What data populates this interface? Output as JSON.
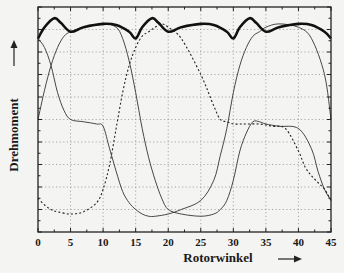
{
  "chart_data": {
    "type": "line",
    "title": "",
    "xlabel": "Rotorwinkel",
    "ylabel": "Drehmoment",
    "xlim": [
      0,
      45
    ],
    "ylim": [
      0,
      10
    ],
    "x_ticks": [
      0,
      5,
      10,
      15,
      20,
      25,
      30,
      35,
      40,
      45
    ],
    "x_tick_labels": [
      "0",
      "5",
      "10",
      "15",
      "20",
      "25",
      "30",
      "35",
      "40",
      "45"
    ],
    "y_ticks_labeled": false,
    "grid": true,
    "legend": "none",
    "series": [
      {
        "name": "Gesamtmoment",
        "style": "thick-solid",
        "x": [
          0,
          1,
          2.5,
          3.5,
          5,
          7,
          10,
          12,
          14,
          15,
          16,
          17.5,
          18.5,
          20,
          22,
          25,
          27,
          29,
          30,
          31,
          32.5,
          33.5,
          35,
          37,
          40,
          42,
          44,
          45
        ],
        "y": [
          8.6,
          9.1,
          9.5,
          9.3,
          8.9,
          9.1,
          9.25,
          9.2,
          8.9,
          8.6,
          9.1,
          9.5,
          9.3,
          8.9,
          9.1,
          9.25,
          9.2,
          8.9,
          8.6,
          9.1,
          9.5,
          9.3,
          8.9,
          9.1,
          9.25,
          9.2,
          8.9,
          8.6
        ]
      },
      {
        "name": "Strang 1",
        "style": "thin-solid",
        "x": [
          0,
          1,
          2,
          3,
          4,
          5,
          7,
          10,
          12,
          13,
          14,
          15,
          16,
          17,
          18,
          19,
          20,
          22,
          25,
          27,
          28,
          29,
          30,
          31,
          32,
          33,
          34,
          35,
          37,
          40,
          42,
          43,
          44,
          45
        ],
        "y": [
          5.0,
          6.3,
          7.4,
          8.2,
          8.7,
          8.9,
          9.1,
          9.25,
          9.1,
          8.6,
          7.6,
          6.2,
          4.6,
          3.3,
          2.3,
          1.5,
          1.0,
          0.8,
          0.7,
          0.8,
          1.0,
          1.4,
          2.3,
          3.6,
          4.4,
          4.9,
          4.9,
          4.8,
          4.7,
          4.6,
          3.7,
          2.7,
          1.9,
          1.4
        ]
      },
      {
        "name": "Strang 2",
        "style": "thin-solid",
        "x": [
          0,
          1,
          2,
          3,
          4,
          5,
          7,
          9,
          10,
          11,
          12,
          13,
          14,
          15,
          16,
          17,
          18,
          20,
          22,
          25,
          27,
          28,
          29,
          30,
          31,
          32,
          33,
          34,
          35,
          37,
          40,
          42,
          44,
          45
        ],
        "y": [
          8.6,
          8.2,
          7.4,
          6.2,
          5.4,
          5.0,
          4.9,
          4.8,
          4.7,
          3.7,
          2.7,
          1.8,
          1.3,
          1.0,
          0.8,
          0.7,
          0.7,
          0.8,
          1.0,
          1.4,
          2.3,
          3.4,
          4.6,
          6.2,
          7.4,
          8.2,
          8.7,
          8.9,
          9.1,
          9.25,
          9.1,
          8.6,
          7.0,
          5.0
        ]
      },
      {
        "name": "Strang 3",
        "style": "dashed",
        "x": [
          0,
          1,
          2,
          3,
          5,
          7,
          9,
          10,
          11,
          12,
          13,
          14,
          15,
          16,
          17,
          18,
          19,
          20,
          22,
          25,
          27,
          28,
          29,
          30,
          31,
          32,
          34,
          36,
          38,
          40,
          41,
          42,
          43,
          44,
          45
        ],
        "y": [
          1.5,
          1.2,
          1.0,
          0.9,
          0.8,
          0.9,
          1.3,
          1.9,
          3.0,
          4.6,
          6.2,
          7.4,
          8.2,
          8.7,
          8.9,
          9.1,
          9.25,
          9.1,
          8.6,
          7.0,
          5.6,
          5.0,
          4.9,
          4.8,
          4.8,
          4.8,
          4.8,
          4.7,
          4.6,
          3.6,
          2.9,
          2.5,
          2.2,
          1.9,
          1.4
        ]
      }
    ]
  },
  "axes": {
    "xlabel": "Rotorwinkel",
    "ylabel": "Drehmoment",
    "x_arrow": "right-arrow-icon",
    "y_arrow": "up-arrow-icon"
  }
}
